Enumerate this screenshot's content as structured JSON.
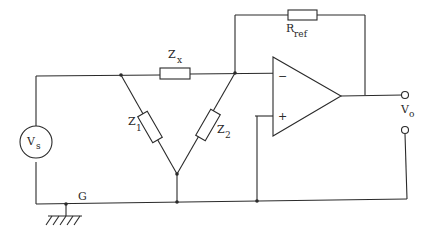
{
  "diagram": {
    "type": "circuit",
    "labels": {
      "zx": {
        "main": "Z",
        "sub": "x"
      },
      "rref": {
        "main": "R",
        "sub": "ref"
      },
      "z1": {
        "main": "Z",
        "sub": "1"
      },
      "z2": {
        "main": "Z",
        "sub": "2"
      },
      "vs": {
        "main": "V",
        "sub": "s"
      },
      "vo": {
        "main": "V",
        "sub": "o"
      },
      "ground": "G",
      "opamp_minus": "−",
      "opamp_plus": "+"
    },
    "components": [
      {
        "id": "Vs",
        "kind": "voltage-source"
      },
      {
        "id": "Zx",
        "kind": "impedance",
        "between": [
          "node-A",
          "node-B"
        ]
      },
      {
        "id": "Z1",
        "kind": "impedance",
        "between": [
          "node-A",
          "node-C"
        ]
      },
      {
        "id": "Z2",
        "kind": "impedance",
        "between": [
          "node-B",
          "node-C"
        ]
      },
      {
        "id": "Rref",
        "kind": "resistor",
        "between": [
          "node-B",
          "opamp-output"
        ]
      },
      {
        "id": "OpAmp",
        "kind": "operational-amplifier"
      },
      {
        "id": "G",
        "kind": "ground"
      }
    ]
  }
}
